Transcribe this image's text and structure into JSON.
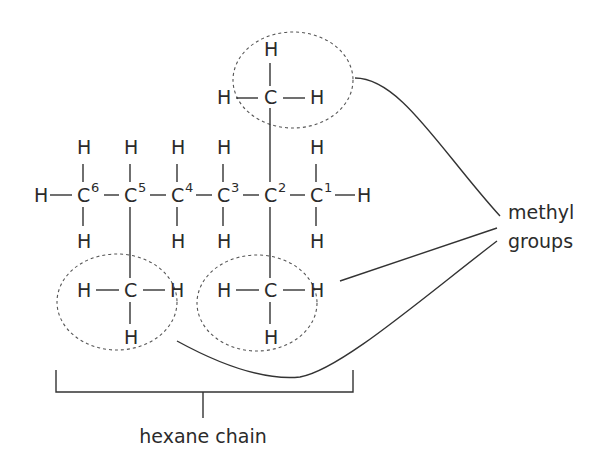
{
  "diagram": {
    "colors": {
      "ink": "#2b2b2b",
      "ellipse": "#555555",
      "background": "#ffffff"
    },
    "atoms": {
      "hydrogen": "H",
      "carbon": "C"
    },
    "chain": {
      "carbons": [
        {
          "label": "C",
          "number": "6"
        },
        {
          "label": "C",
          "number": "5"
        },
        {
          "label": "C",
          "number": "4"
        },
        {
          "label": "C",
          "number": "3"
        },
        {
          "label": "C",
          "number": "2"
        },
        {
          "label": "C",
          "number": "1"
        }
      ]
    },
    "methyl_groups": [
      {
        "position": "top, on C2",
        "atoms": [
          "H",
          "H",
          "C",
          "H"
        ]
      },
      {
        "position": "bottom, on C5",
        "atoms": [
          "H",
          "C",
          "H",
          "H"
        ]
      },
      {
        "position": "bottom, on C2",
        "atoms": [
          "H",
          "C",
          "H",
          "H"
        ]
      }
    ],
    "labels": {
      "methyl_line1": "methyl",
      "methyl_line2": "groups",
      "hexane": "hexane chain"
    }
  }
}
